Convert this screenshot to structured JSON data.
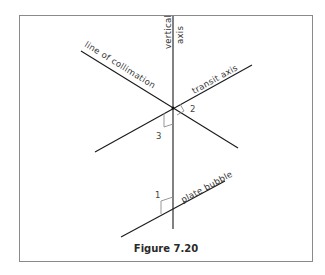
{
  "figure": {
    "caption": "Figure 7.20",
    "line_color": "#1a1a1a",
    "marker_color": "#8c8c8c",
    "frame_color": "#8a8a8a"
  },
  "labels": {
    "vertical_axis_1": "vertical",
    "vertical_axis_2": "axis",
    "line_of_collimation": "line of collimation",
    "transit_axis": "transit axis",
    "plate_bubble": "plate bubble"
  },
  "angle_markers": {
    "marker_1": "1",
    "marker_2": "2",
    "marker_3": "3"
  }
}
